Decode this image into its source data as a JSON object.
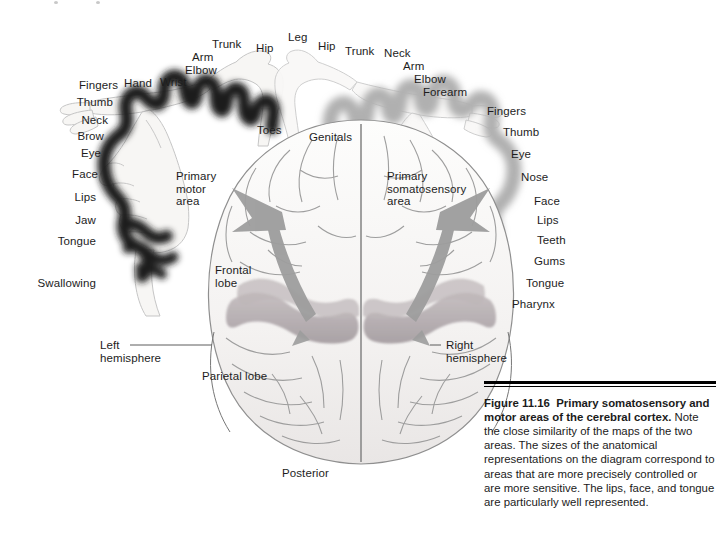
{
  "figure": {
    "id": "Figure 11.16",
    "title": "Primary somatosensory and motor areas of the cerebral cortex.",
    "body": " Note the close similarity of the maps of the two areas. The sizes of the anatomical representations on the diagram correspond to areas that are more precisely controlled or are more sensitive. The lips, face, and tongue are particularly well represented.",
    "orientation_label": "Posterior"
  },
  "colors": {
    "motor_band": "#2b2b2b",
    "sensory_band": "#b9b9b9",
    "brain_fill": "#f6f5f3",
    "brain_line": "#8a8a8a",
    "gyri_shade": "#b4aeb0",
    "arrow": "#9a9a9a",
    "homunculus_line": "#bdbdbd",
    "text": "#1d1d1d",
    "rule": "#000000"
  },
  "motor_map": {
    "area_label": "Primary\nmotor\narea",
    "area_label_line1": "Primary",
    "area_label_line2": "motor",
    "area_label_line3": "area",
    "labels_top": [
      {
        "text": "Trunk",
        "x": 212,
        "y": 38
      },
      {
        "text": "Hip",
        "x": 253,
        "y": 41
      },
      {
        "text": "Arm",
        "x": 191,
        "y": 51
      },
      {
        "text": "Elbow",
        "x": 192,
        "y": 63
      },
      {
        "text": "Wrist",
        "x": 161,
        "y": 75
      },
      {
        "text": "Hand",
        "x": 126,
        "y": 76
      },
      {
        "text": "Toes",
        "x": 258,
        "y": 124
      }
    ],
    "labels_left": [
      {
        "text": "Fingers",
        "x": 78,
        "y": 79,
        "w": 54
      },
      {
        "text": "Thumb",
        "x": 64,
        "y": 95,
        "w": 54
      },
      {
        "text": "Neck",
        "x": 63,
        "y": 113,
        "w": 54
      },
      {
        "text": "Brow",
        "x": 58,
        "y": 130,
        "w": 54
      },
      {
        "text": "Eye",
        "x": 56,
        "y": 146,
        "w": 54
      },
      {
        "text": "Face",
        "x": 52,
        "y": 168,
        "w": 54
      },
      {
        "text": "Lips",
        "x": 51,
        "y": 191,
        "w": 54
      },
      {
        "text": "Jaw",
        "x": 51,
        "y": 214,
        "w": 54
      },
      {
        "text": "Tongue",
        "x": 40,
        "y": 235,
        "w": 66
      },
      {
        "text": "Swallowing",
        "x": 26,
        "y": 277,
        "w": 80
      }
    ]
  },
  "sensory_map": {
    "area_label_line1": "Primary",
    "area_label_line2": "somatosensory",
    "area_label_line3": "area",
    "labels_top": [
      {
        "text": "Leg",
        "x": 288,
        "y": 31
      },
      {
        "text": "Hip",
        "x": 318,
        "y": 40
      },
      {
        "text": "Trunk",
        "x": 344,
        "y": 45
      },
      {
        "text": "Neck",
        "x": 383,
        "y": 47
      },
      {
        "text": "Arm",
        "x": 403,
        "y": 60
      },
      {
        "text": "Elbow",
        "x": 415,
        "y": 73
      },
      {
        "text": "Forearm",
        "x": 424,
        "y": 86
      },
      {
        "text": "Genitals",
        "x": 309,
        "y": 131
      }
    ],
    "labels_right": [
      {
        "text": "Fingers",
        "x": 489,
        "y": 106
      },
      {
        "text": "Thumb",
        "x": 504,
        "y": 126
      },
      {
        "text": "Eye",
        "x": 511,
        "y": 149
      },
      {
        "text": "Nose",
        "x": 522,
        "y": 172
      },
      {
        "text": "Face",
        "x": 535,
        "y": 196
      },
      {
        "text": "Lips",
        "x": 537,
        "y": 215
      },
      {
        "text": "Teeth",
        "x": 538,
        "y": 235
      },
      {
        "text": "Gums",
        "x": 535,
        "y": 256
      },
      {
        "text": "Tongue",
        "x": 527,
        "y": 278
      },
      {
        "text": "Pharynx",
        "x": 513,
        "y": 299
      }
    ]
  },
  "brain": {
    "frontal_lobe": "Frontal\nlobe",
    "frontal_lobe_line1": "Frontal",
    "frontal_lobe_line2": "lobe",
    "parietal_lobe": "Parietal lobe",
    "left_hemisphere_line1": "Left",
    "left_hemisphere_line2": "hemisphere",
    "right_hemisphere_line1": "Right",
    "right_hemisphere_line2": "hemisphere",
    "posterior": "Posterior"
  }
}
